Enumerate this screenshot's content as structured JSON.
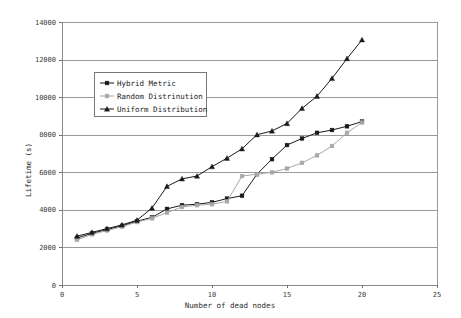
{
  "chart_data": {
    "type": "line",
    "title": "",
    "xlabel": "Number of dead nodes",
    "ylabel": "Lifetime (s)",
    "xlim": [
      0,
      25
    ],
    "ylim": [
      0,
      14000
    ],
    "xticks": [
      0,
      5,
      10,
      15,
      20,
      25
    ],
    "yticks": [
      0,
      2000,
      4000,
      6000,
      8000,
      10000,
      12000,
      14000
    ],
    "xtick_labels": [
      "0",
      "5",
      "10",
      "15",
      "20",
      "25"
    ],
    "ytick_labels": [
      "0",
      "2000",
      "4000",
      "6000",
      "8000",
      "10000",
      "12000",
      "14000"
    ],
    "grid": "horizontal",
    "legend_position": "upper-left-inside",
    "series": [
      {
        "name": "Hybrid Metric",
        "marker": "square",
        "color": "#1a1a1a",
        "x": [
          1,
          2,
          3,
          4,
          5,
          6,
          7,
          8,
          9,
          10,
          11,
          12,
          13,
          14,
          15,
          16,
          17,
          18,
          19,
          20
        ],
        "values": [
          2500,
          2750,
          2950,
          3150,
          3400,
          3600,
          4050,
          4250,
          4300,
          4400,
          4600,
          4750,
          5900,
          6700,
          7450,
          7800,
          8100,
          8250,
          8450,
          8700
        ]
      },
      {
        "name": "Random Distrinution",
        "marker": "square",
        "color": "#a8a8a8",
        "x": [
          1,
          2,
          3,
          4,
          5,
          6,
          7,
          8,
          9,
          10,
          11,
          12,
          13,
          14,
          15,
          16,
          17,
          18,
          19,
          20
        ],
        "values": [
          2400,
          2700,
          2900,
          3100,
          3350,
          3550,
          3850,
          4150,
          4250,
          4300,
          4450,
          5800,
          5900,
          6000,
          6200,
          6500,
          6900,
          7400,
          8100,
          8650
        ]
      },
      {
        "name": "Uniform Distribution",
        "marker": "triangle",
        "color": "#1a1a1a",
        "x": [
          1,
          2,
          3,
          4,
          5,
          6,
          7,
          8,
          9,
          10,
          11,
          12,
          13,
          14,
          15,
          16,
          17,
          18,
          19,
          20
        ],
        "values": [
          2600,
          2800,
          3000,
          3200,
          3450,
          4100,
          5250,
          5650,
          5800,
          6300,
          6750,
          7250,
          8000,
          8200,
          8600,
          9400,
          10050,
          11000,
          12050,
          13050
        ]
      }
    ]
  },
  "legend": {
    "entries": [
      {
        "label": "Hybrid Metric"
      },
      {
        "label": "Random Distrinution"
      },
      {
        "label": "Uniform Distribution"
      }
    ]
  }
}
